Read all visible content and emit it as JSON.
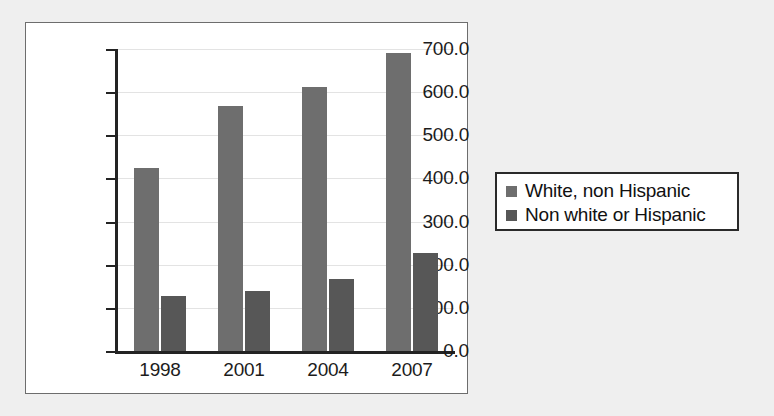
{
  "chart_data": {
    "type": "bar",
    "title": "",
    "subtitle": "",
    "xlabel": "",
    "ylabel": "",
    "categories": [
      "1998",
      "2001",
      "2004",
      "2007"
    ],
    "series": [
      {
        "name": "White, non Hispanic",
        "color": "#6e6e6e",
        "values": [
          425,
          568,
          613,
          690
        ]
      },
      {
        "name": "Non white or Hispanic",
        "color": "#575757",
        "values": [
          127,
          139,
          168,
          228
        ]
      }
    ],
    "ylim": [
      0,
      700
    ],
    "ytick_labels": [
      "700.0",
      "600.0",
      "500.0",
      "400.0",
      "300.0",
      "200.0",
      "100.0",
      "0.0"
    ],
    "ytick_values": [
      700,
      600,
      500,
      400,
      300,
      200,
      100,
      0
    ],
    "grid": true,
    "legend_position": "right",
    "background_color": "#efefef",
    "plot_background_color": "#ffffff",
    "axis_color": "#232323"
  },
  "legend": {
    "entries": [
      {
        "label": "White, non Hispanic",
        "color": "#6e6e6e"
      },
      {
        "label": "Non white or Hispanic",
        "color": "#575757"
      }
    ]
  }
}
